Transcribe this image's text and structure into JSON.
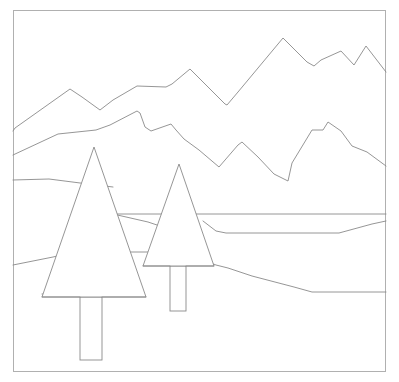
{
  "artwork": {
    "title": "Minimalist Mountain Landscape Line Drawing",
    "description": "Black-and-white outline drawing of a mountain range with layered ridges, rolling terrain bands, and two coniferous trees in the foreground.",
    "background_color": "#ffffff",
    "stroke_color": "#8a8a8a",
    "frame_color": "#b0b0b0",
    "stroke_width": 0.9,
    "canvas": {
      "width": 399,
      "height": 382
    },
    "frame": {
      "x": 13,
      "y": 10,
      "width": 373,
      "height": 362
    },
    "artifact_speck": {
      "x": 18,
      "y": 1,
      "width": 5,
      "height": 3,
      "color": "#cfcfcf"
    },
    "elements": [
      {
        "name": "back-mountain-ridge",
        "kind": "polyline",
        "points": "13,131 15,128 70,89 82,97 100,110 113,100 137,86 166,87 172,84 190,69 209,88 225,104 227,105 238,92 283,38 307,62 314,66 321,60 341,51 354,65 366,46 386,72"
      },
      {
        "name": "mid-mountain-ridge",
        "kind": "polyline",
        "points": "13,155 58,134 96,130 110,125 137,111 140,113 145,127 151,131 171,124 176,130 184,139 199,150 219,167 238,145 242,142 258,157 274,174 288,181 292,163 312,130 323,130 328,122 341,131 352,146 367,152 386,166"
      },
      {
        "name": "terrain-band-upper",
        "kind": "polyline",
        "points": "13,180 49,179 88,184 105,186 113,187"
      },
      {
        "name": "terrain-band-horizon",
        "kind": "polyline",
        "points": "111,214 164,214 209,214 230,214 300,214 386,214"
      },
      {
        "name": "terrain-band-midslope",
        "kind": "polyline",
        "points": "113,214 148,222 160,226 167,228"
      },
      {
        "name": "terrain-band-valley",
        "kind": "polyline",
        "points": "203,221 216,231 226,233 263,233 339,233 372,224 386,221"
      },
      {
        "name": "terrain-band-lower-left",
        "kind": "polyline",
        "points": "13,265 53,257 79,251"
      },
      {
        "name": "terrain-band-lower-plateau",
        "kind": "polyline",
        "points": "42,294 66,294 112,294 132,294"
      },
      {
        "name": "terrain-band-lower-right",
        "kind": "polyline",
        "points": "203,260 216,265 228,268 252,276 294,287 312,292 386,292"
      },
      {
        "name": "terrain-band-tree-notch",
        "kind": "polyline",
        "points": "126,252 143,252 158,252"
      },
      {
        "name": "tree-large-canopy",
        "kind": "polygon",
        "points": "94,147 146,297 42,297"
      },
      {
        "name": "tree-large-trunk",
        "kind": "rect",
        "x": 80,
        "y": 297,
        "width": 22,
        "height": 63
      },
      {
        "name": "tree-small-canopy",
        "kind": "polygon",
        "points": "179,164 214,266 143,266"
      },
      {
        "name": "tree-small-trunk",
        "kind": "rect",
        "x": 170,
        "y": 266,
        "width": 16,
        "height": 45
      }
    ]
  }
}
